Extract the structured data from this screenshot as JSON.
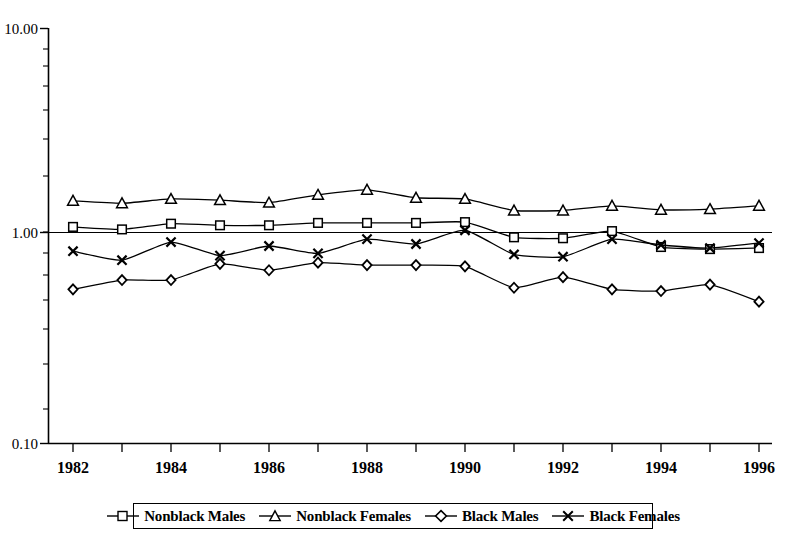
{
  "chart_data": {
    "type": "line",
    "title": "",
    "subtitle": "",
    "xlabel": "",
    "ylabel": "",
    "yscale": "log",
    "ylim": [
      0.1,
      10.0
    ],
    "ytick_labels": [
      "10.00",
      "1.00",
      "0.10"
    ],
    "ytick_values": [
      10.0,
      1.0,
      0.1
    ],
    "minor_ticks": true,
    "grid": false,
    "reference_line": 1.0,
    "legend_position": "bottom",
    "x": [
      1982,
      1983,
      1984,
      1985,
      1986,
      1987,
      1988,
      1989,
      1990,
      1991,
      1992,
      1993,
      1994,
      1995,
      1996
    ],
    "xtick_labels": [
      "1982",
      "1984",
      "1986",
      "1988",
      "1990",
      "1992",
      "1994",
      "1996"
    ],
    "xtick_values": [
      1982,
      1984,
      1986,
      1988,
      1990,
      1992,
      1994,
      1996
    ],
    "xlim": [
      1981.5,
      1996.5
    ],
    "series": [
      {
        "name": "Nonblack Males",
        "marker": "square",
        "values": [
          1.1,
          1.07,
          1.14,
          1.12,
          1.12,
          1.15,
          1.15,
          1.15,
          1.16,
          0.98,
          0.97,
          1.05,
          0.88,
          0.86,
          0.87
        ]
      },
      {
        "name": "Nonblack Females",
        "marker": "triangle",
        "values": [
          1.47,
          1.43,
          1.5,
          1.48,
          1.44,
          1.57,
          1.66,
          1.52,
          1.5,
          1.32,
          1.32,
          1.39,
          1.33,
          1.34,
          1.39
        ]
      },
      {
        "name": "Black Males",
        "marker": "diamond",
        "values": [
          0.55,
          0.61,
          0.61,
          0.73,
          0.68,
          0.74,
          0.72,
          0.72,
          0.71,
          0.56,
          0.63,
          0.55,
          0.54,
          0.58,
          0.48
        ]
      },
      {
        "name": "Black Females",
        "marker": "cross",
        "values": [
          0.84,
          0.76,
          0.93,
          0.8,
          0.89,
          0.82,
          0.96,
          0.91,
          1.06,
          0.81,
          0.79,
          0.96,
          0.9,
          0.87,
          0.92
        ]
      }
    ]
  },
  "legend": {
    "items": [
      {
        "label": "Nonblack Males",
        "marker": "square-marker"
      },
      {
        "label": "Nonblack Females",
        "marker": "triangle-marker"
      },
      {
        "label": "Black Males",
        "marker": "diamond-marker"
      },
      {
        "label": "Black Females",
        "marker": "cross-marker"
      }
    ]
  }
}
